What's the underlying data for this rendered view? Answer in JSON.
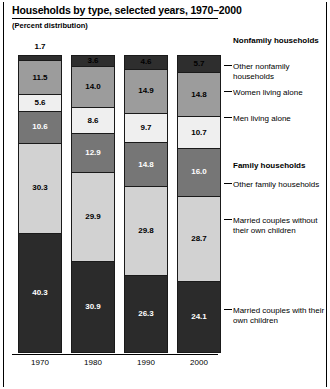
{
  "header": {
    "title": "Households by type, selected years, 1970–2000",
    "subtitle": "(Percent distribution)"
  },
  "legend": {
    "groups": [
      {
        "name": "nonfamily-households",
        "label": "Nonfamily households"
      },
      {
        "name": "family-households",
        "label": "Family households"
      }
    ],
    "entries": [
      {
        "name": "other-nonfamily-households",
        "label": "Other nonfamily households",
        "color": "#2e2e2e"
      },
      {
        "name": "women-living-alone",
        "label": "Women living alone",
        "color": "#9c9c9c"
      },
      {
        "name": "men-living-alone",
        "label": "Men living alone",
        "color": "#efefef"
      },
      {
        "name": "other-family-households",
        "label": "Other family households",
        "color": "#767676"
      },
      {
        "name": "married-couples-without-own-children",
        "label": "Married couples without their own children",
        "color": "#d2d2d2"
      },
      {
        "name": "married-couples-with-own-children",
        "label": "Married couples with their own children",
        "color": "#2b2b2b"
      }
    ]
  },
  "chart_data": {
    "type": "bar",
    "title": "Households by type, selected years, 1970–2000",
    "subtitle": "(Percent distribution)",
    "xlabel": "",
    "ylabel": "",
    "ylim": [
      0,
      100
    ],
    "grid": false,
    "stacked": true,
    "legend_position": "right",
    "categories": [
      "1970",
      "1980",
      "1990",
      "2000"
    ],
    "series": [
      {
        "name": "Other nonfamily households",
        "color": "#2e2e2e",
        "values": [
          1.7,
          3.6,
          4.6,
          5.7
        ],
        "label_outside": [
          true,
          false,
          false,
          false
        ]
      },
      {
        "name": "Women living alone",
        "color": "#9c9c9c",
        "values": [
          11.5,
          14.0,
          14.9,
          14.8
        ]
      },
      {
        "name": "Men living alone",
        "color": "#efefef",
        "values": [
          5.6,
          8.6,
          9.7,
          10.7
        ]
      },
      {
        "name": "Other family households",
        "color": "#767676",
        "values": [
          10.6,
          12.9,
          14.8,
          16.0
        ]
      },
      {
        "name": "Married couples without their own children",
        "color": "#d2d2d2",
        "values": [
          30.3,
          29.9,
          29.8,
          28.7
        ]
      },
      {
        "name": "Married couples with their own children",
        "color": "#2b2b2b",
        "values": [
          40.3,
          30.9,
          26.3,
          24.1
        ]
      }
    ],
    "labels": {
      "1970": [
        "1.7",
        "11.5",
        "5.6",
        "10.6",
        "30.3",
        "40.3"
      ],
      "1980": [
        "3.6",
        "14.0",
        "8.6",
        "12.9",
        "29.9",
        "30.9"
      ],
      "1990": [
        "4.6",
        "14.9",
        "9.7",
        "14.8",
        "29.8",
        "26.3"
      ],
      "2000": [
        "5.7",
        "14.8",
        "10.7",
        "16.0",
        "28.7",
        "24.1"
      ]
    }
  }
}
